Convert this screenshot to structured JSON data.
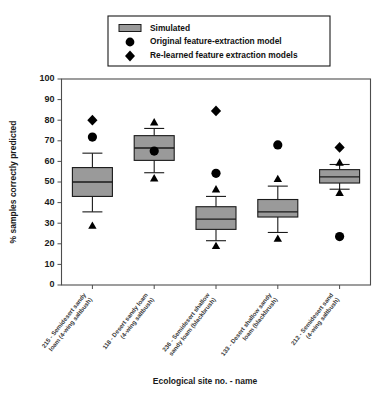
{
  "chart_data": {
    "type": "box",
    "title": "",
    "xlabel": "Ecological site no. - name",
    "ylabel": "% samples correctly predicted",
    "ylim": [
      0,
      100
    ],
    "ytick_step": 10,
    "yticks": [
      0,
      10,
      20,
      30,
      40,
      50,
      60,
      70,
      80,
      90,
      100
    ],
    "grid": false,
    "legend_position": "top-center",
    "legend": [
      {
        "key": "simulated",
        "label": "Simulated",
        "marker": "gray-box"
      },
      {
        "key": "original",
        "label": "Original feature-extraction model",
        "marker": "circle"
      },
      {
        "key": "relearned",
        "label": "Re-learned feature extraction models",
        "marker": "diamond"
      }
    ],
    "categories": [
      "215 - Semidesert sandy loam (4-wing saltbush)",
      "118 - Desert sandy loam (4-wing saltbush)",
      "236 - Semidesert shallow sandy loam (blackbrush)",
      "133 - Desert shallow sandy loam (blackbrush)",
      "212 - Semidesert sand (4-wing saltbush)"
    ],
    "categories_lines": [
      [
        "215 - Semidesert sandy",
        "loam (4-wing saltbush)"
      ],
      [
        "118 - Desert sandy loam",
        "(4-wing saltbush)"
      ],
      [
        "236 - Semidesert shallow",
        "sandy loam (blackbrush)"
      ],
      [
        "133 - Desert shallow sandy",
        "loam (blackbrush)"
      ],
      [
        "212 - Semidesert sand",
        "(4-wing saltbush)"
      ]
    ],
    "boxes": [
      {
        "category": "215",
        "whisker_low": 35.5,
        "q1": 43.0,
        "median": 50.0,
        "q3": 57.0,
        "whisker_high": 64.0
      },
      {
        "category": "118",
        "whisker_low": 54.5,
        "q1": 60.5,
        "median": 66.5,
        "q3": 72.5,
        "whisker_high": 76.0
      },
      {
        "category": "236",
        "whisker_low": 21.5,
        "q1": 27.0,
        "median": 32.0,
        "q3": 38.0,
        "whisker_high": 43.0
      },
      {
        "category": "133",
        "whisker_low": 25.5,
        "q1": 33.0,
        "median": 35.5,
        "q3": 41.5,
        "whisker_high": 48.0
      },
      {
        "category": "212",
        "whisker_low": 46.5,
        "q1": 49.5,
        "median": 52.5,
        "q3": 56.0,
        "whisker_high": 58.5
      }
    ],
    "series": [
      {
        "name": "Original feature-extraction model",
        "marker": "circle",
        "values": [
          71.8,
          65.0,
          54.2,
          68.0,
          23.5
        ]
      },
      {
        "name": "Re-learned feature extraction models",
        "marker": "diamond",
        "values": [
          80.0,
          null,
          84.5,
          null,
          66.8
        ]
      },
      {
        "name": "Re-learned feature extraction models (additional)",
        "marker": "triangle",
        "values_upper": [
          null,
          79.0,
          46.5,
          51.5,
          59.5
        ],
        "values_lower": [
          28.8,
          51.8,
          19.0,
          22.5,
          44.8
        ]
      }
    ]
  }
}
